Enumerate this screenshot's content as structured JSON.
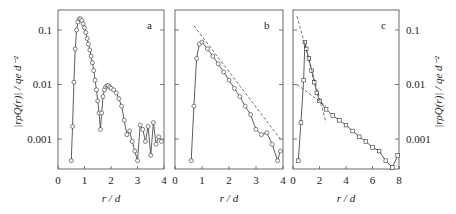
{
  "chart_data": [
    {
      "type": "scatter",
      "panel": "a",
      "xlabel": "r / d",
      "ylabel": "|r ρQ(r)| / q_e d^-2",
      "xlim": [
        0,
        4
      ],
      "ylim": [
        0.0003,
        0.18
      ],
      "yscale": "log",
      "xticks": [
        "0",
        "1",
        "2",
        "3",
        "4"
      ],
      "yticks": [
        "0.1",
        "0.01",
        "0.001"
      ],
      "series": [
        {
          "name": "data",
          "marker": "circle",
          "x": [
            0.5,
            0.55,
            0.6,
            0.65,
            0.7,
            0.75,
            0.8,
            0.85,
            0.9,
            0.95,
            1.0,
            1.05,
            1.1,
            1.15,
            1.2,
            1.25,
            1.3,
            1.35,
            1.4,
            1.45,
            1.5,
            1.55,
            1.6,
            1.65,
            1.7,
            1.75,
            1.8,
            1.85,
            1.9,
            1.95,
            2.0,
            2.1,
            2.2,
            2.3,
            2.4,
            2.5,
            2.6,
            2.7,
            2.8,
            2.9,
            3.0,
            3.1,
            3.2,
            3.3,
            3.4,
            3.5,
            3.6,
            3.7,
            3.8,
            3.9
          ],
          "y": [
            0.0004,
            0.0017,
            0.011,
            0.045,
            0.1,
            0.14,
            0.16,
            0.16,
            0.15,
            0.13,
            0.11,
            0.09,
            0.07,
            0.055,
            0.043,
            0.033,
            0.025,
            0.018,
            0.012,
            0.008,
            0.005,
            0.003,
            0.0015,
            0.003,
            0.006,
            0.008,
            0.009,
            0.0095,
            0.0095,
            0.009,
            0.0085,
            0.008,
            0.007,
            0.0055,
            0.004,
            0.0022,
            0.0012,
            0.0014,
            0.0009,
            0.0006,
            0.0004,
            0.0018,
            0.0015,
            0.0009,
            0.0017,
            0.0005,
            0.002,
            0.0008,
            0.0011,
            0.0009
          ]
        }
      ],
      "annotation": "a"
    },
    {
      "type": "scatter",
      "panel": "b",
      "xlabel": "r / d",
      "xlim": [
        0,
        4
      ],
      "yscale": "log",
      "xticks": [
        "0",
        "1",
        "2",
        "3",
        "4"
      ],
      "series": [
        {
          "name": "data",
          "marker": "circle",
          "x": [
            0.6,
            0.7,
            0.8,
            0.9,
            1.0,
            1.2,
            1.4,
            1.6,
            1.8,
            2.0,
            2.2,
            2.4,
            2.6,
            2.8,
            3.0,
            3.2,
            3.4,
            3.6,
            3.8,
            3.9
          ],
          "y": [
            0.0004,
            0.004,
            0.03,
            0.055,
            0.06,
            0.045,
            0.033,
            0.024,
            0.017,
            0.012,
            0.0085,
            0.006,
            0.004,
            0.0028,
            0.0015,
            0.0012,
            0.0013,
            0.0008,
            0.0004,
            0.0006
          ]
        },
        {
          "name": "exponential fit",
          "style": "dashed",
          "x": [
            0.7,
            3.9
          ],
          "y": [
            0.12,
            0.001
          ]
        }
      ],
      "annotation": "b"
    },
    {
      "type": "scatter",
      "panel": "c",
      "xlabel": "r / d",
      "ylabel": "|r ρQ(r)| / q_e d^-2",
      "xlim": [
        0,
        8
      ],
      "yscale": "log",
      "xticks": [
        "0",
        "2",
        "4",
        "6",
        "8"
      ],
      "yticks": [
        "0.1",
        "0.01",
        "0.001"
      ],
      "series": [
        {
          "name": "data",
          "marker": "square",
          "x": [
            0.4,
            0.6,
            0.8,
            0.9,
            1.0,
            1.2,
            1.4,
            1.6,
            1.8,
            2.0,
            2.5,
            3.0,
            3.5,
            4.0,
            4.5,
            5.0,
            5.5,
            6.0,
            6.5,
            7.0,
            7.5,
            7.9
          ],
          "y": [
            0.0004,
            0.002,
            0.012,
            0.06,
            0.045,
            0.03,
            0.018,
            0.011,
            0.007,
            0.005,
            0.0035,
            0.0027,
            0.0022,
            0.0018,
            0.0014,
            0.0011,
            0.0009,
            0.0007,
            0.0006,
            0.0004,
            0.0003,
            0.0005
          ]
        },
        {
          "name": "fast decay fit",
          "style": "dashed",
          "x": [
            0.3,
            2.5
          ],
          "y": [
            0.18,
            0.002
          ]
        },
        {
          "name": "slow decay fit",
          "style": "dashed",
          "x": [
            0.3,
            2.5
          ],
          "y": [
            0.01,
            0.004
          ]
        }
      ],
      "annotation": "c"
    }
  ],
  "labels": {
    "panel_a": "a",
    "panel_b": "b",
    "panel_c": "c",
    "xlabel": "r / d",
    "ylabel": "|rρQ(r)| / qe d⁻²",
    "ytick_01": "0.1",
    "ytick_001": "0.01",
    "ytick_0001": "0.001",
    "xt0": "0",
    "xt1": "1",
    "xt2": "2",
    "xt3": "3",
    "xt4": "4",
    "ct0": "0",
    "ct2": "2",
    "ct4": "4",
    "ct6": "6",
    "ct8": "8"
  }
}
